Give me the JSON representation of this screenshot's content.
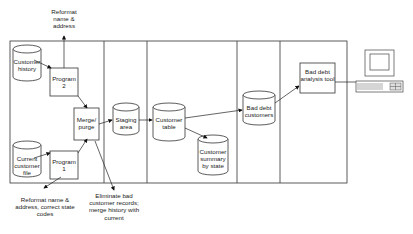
{
  "diagram": {
    "stores": {
      "customer_history": "Customer history",
      "current_customer_file": "Current customer file",
      "staging_area": "Staging area",
      "customer_table": "Customer table",
      "customer_summary": "Customer summary by state",
      "bad_debt_customers": "Bad debt customers"
    },
    "processes": {
      "program2": "Program 2",
      "program1": "Program 1",
      "merge_purge": "Merge/ purge",
      "bad_debt_tool": "Bad debt analysis tool"
    },
    "annotations": {
      "top": "Reformat name & address",
      "bottom_left": "Reformat name & address, correct state codes",
      "bottom_mid": "Eliminate bad customer records; merge history with current"
    },
    "icons": {
      "terminal": "computer-terminal-icon"
    },
    "colors": {
      "line": "#222222",
      "background": "#ffffff"
    }
  }
}
